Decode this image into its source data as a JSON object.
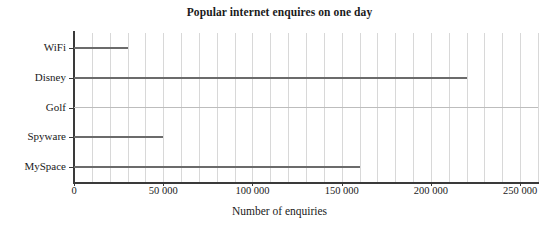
{
  "chart_data": {
    "type": "bar",
    "orientation": "horizontal",
    "title": "Popular internet enquires on one day",
    "xlabel": "Number of enquiries",
    "ylabel": "",
    "categories": [
      "WiFi",
      "Disney",
      "Golf",
      "Spyware",
      "MySpace"
    ],
    "values": [
      30000,
      220000,
      260000,
      50000,
      160000
    ],
    "xlim": [
      0,
      260000
    ],
    "xticks": [
      0,
      50000,
      100000,
      150000,
      200000,
      250000
    ],
    "xtick_labels": [
      "0",
      "50 000",
      "100 000",
      "150 000",
      "200 000",
      "250 000"
    ],
    "minor_gridline_step": 10000,
    "grid": "vertical",
    "legend": "none",
    "bar_color": "#6b6b6b",
    "gridline_color": "#d8d8d8",
    "axis_color": "#3a3a3a",
    "background_color": "#ffffff"
  }
}
